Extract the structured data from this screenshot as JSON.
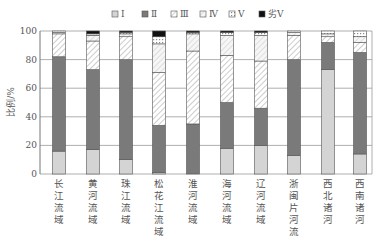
{
  "chart_data": {
    "type": "bar",
    "stacked": true,
    "title": "",
    "xlabel": "",
    "ylabel": "比例/%",
    "ylim": [
      0,
      100
    ],
    "yticks": [
      0,
      20,
      40,
      60,
      80,
      100
    ],
    "grid": true,
    "legend_position": "top",
    "categories": [
      "长江流域",
      "黄河流域",
      "珠江流域",
      "松花江流域",
      "淮河流域",
      "海河流域",
      "辽河流域",
      "浙闽片河流",
      "西北诸河",
      "西南诸河"
    ],
    "series": [
      {
        "name": "Ⅰ",
        "values": [
          16,
          17,
          10,
          1,
          0,
          18,
          20,
          13,
          73,
          14
        ],
        "color": "#d4d4d4",
        "pattern": "solid-light"
      },
      {
        "name": "Ⅱ",
        "values": [
          66,
          56,
          70,
          33,
          35,
          32,
          26,
          67,
          19,
          71
        ],
        "color": "#7a7a7a",
        "pattern": "solid-dark"
      },
      {
        "name": "Ⅲ",
        "values": [
          16,
          20,
          16,
          37,
          51,
          33,
          33,
          17,
          4,
          7
        ],
        "color": "#ffffff",
        "pattern": "hatch"
      },
      {
        "name": "Ⅳ",
        "values": [
          1,
          4,
          2,
          20,
          12,
          14,
          18,
          2,
          2,
          4
        ],
        "color": "#ffffff",
        "pattern": "hatch-light"
      },
      {
        "name": "Ⅴ",
        "values": [
          1,
          1,
          1,
          5,
          1,
          2,
          2,
          1,
          2,
          4
        ],
        "color": "#ffffff",
        "pattern": "dotted-hatch"
      },
      {
        "name": "劣Ⅴ",
        "values": [
          0,
          2,
          1,
          4,
          1,
          1,
          1,
          0,
          0,
          0
        ],
        "color": "#111111",
        "pattern": "solid-black"
      }
    ]
  },
  "legend": {
    "items": [
      "Ⅰ",
      "Ⅱ",
      "Ⅲ",
      "Ⅳ",
      "Ⅴ",
      "劣Ⅴ"
    ]
  },
  "axis": {
    "ylabel": "比例/%",
    "yticks": [
      "0",
      "20",
      "40",
      "60",
      "80",
      "100"
    ]
  }
}
